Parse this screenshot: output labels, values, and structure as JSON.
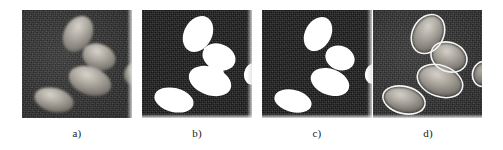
{
  "figure": {
    "panel_count": 4,
    "background_color": "#ffffff",
    "panel_background_color": "#2d2d2d",
    "mask_foreground_color": "#ffffff",
    "contour_color": "#f2f2f2"
  },
  "panels": [
    {
      "label": "a)",
      "name": "original-grayscale-image",
      "caption": "a)",
      "kind": "grayscale-microscopy",
      "object_count": 4,
      "objects": [
        {
          "id": "cell-1",
          "cx": 56,
          "cy": 24,
          "rx": 14,
          "ry": 19,
          "rot": 28,
          "fill": "#a9a49a"
        },
        {
          "id": "cell-2",
          "cx": 77,
          "cy": 47,
          "rx": 17,
          "ry": 13,
          "rot": 22,
          "fill": "#9b968e"
        },
        {
          "id": "cell-3",
          "cx": 68,
          "cy": 71,
          "rx": 22,
          "ry": 14,
          "rot": 20,
          "fill": "#a8a39a"
        },
        {
          "id": "cell-4",
          "cx": 32,
          "cy": 90,
          "rx": 20,
          "ry": 12,
          "rot": 14,
          "fill": "#9d988f"
        },
        {
          "id": "cell-5-partial",
          "cx": 110,
          "cy": 64,
          "rx": 9,
          "ry": 11,
          "rot": 10,
          "fill": "#6e6a64"
        }
      ]
    },
    {
      "label": "b)",
      "name": "binary-threshold-mask",
      "caption": "b)",
      "kind": "binary-mask",
      "object_count": 4,
      "objects": [
        {
          "id": "blob-1",
          "cx": 56,
          "cy": 24,
          "rx": 14,
          "ry": 19,
          "rot": 28,
          "fill": "#ffffff"
        },
        {
          "id": "blob-2",
          "cx": 77,
          "cy": 47,
          "rx": 17,
          "ry": 13,
          "rot": 22,
          "fill": "#ffffff"
        },
        {
          "id": "blob-3",
          "cx": 68,
          "cy": 71,
          "rx": 22,
          "ry": 14,
          "rot": 20,
          "fill": "#ffffff"
        },
        {
          "id": "blob-4",
          "cx": 32,
          "cy": 90,
          "rx": 20,
          "ry": 12,
          "rot": 14,
          "fill": "#ffffff"
        },
        {
          "id": "blob-5-partial",
          "cx": 110,
          "cy": 64,
          "rx": 9,
          "ry": 11,
          "rot": 10,
          "fill": "#ffffff"
        }
      ],
      "objects_touching": true
    },
    {
      "label": "c)",
      "name": "separated-objects-mask",
      "caption": "c)",
      "kind": "binary-mask-separated",
      "object_count": 4,
      "objects": [
        {
          "id": "blob-1",
          "cx": 56,
          "cy": 24,
          "rx": 13,
          "ry": 18,
          "rot": 28,
          "fill": "#ffffff"
        },
        {
          "id": "blob-2",
          "cx": 78,
          "cy": 48,
          "rx": 15,
          "ry": 12,
          "rot": 22,
          "fill": "#ffffff"
        },
        {
          "id": "blob-3",
          "cx": 68,
          "cy": 72,
          "rx": 20,
          "ry": 13,
          "rot": 20,
          "fill": "#ffffff"
        },
        {
          "id": "blob-4",
          "cx": 31,
          "cy": 91,
          "rx": 19,
          "ry": 11,
          "rot": 14,
          "fill": "#ffffff"
        },
        {
          "id": "blob-5-partial",
          "cx": 110,
          "cy": 64,
          "rx": 8,
          "ry": 10,
          "rot": 10,
          "fill": "#ffffff"
        }
      ],
      "objects_touching": false
    },
    {
      "label": "d)",
      "name": "contour-overlay-result",
      "caption": "d)",
      "kind": "grayscale-with-contours",
      "object_count": 4,
      "objects": [
        {
          "id": "cell-1",
          "cx": 56,
          "cy": 24,
          "rx": 14,
          "ry": 19,
          "rot": 28,
          "fill": "#a9a49a"
        },
        {
          "id": "cell-2",
          "cx": 77,
          "cy": 47,
          "rx": 17,
          "ry": 13,
          "rot": 22,
          "fill": "#9b968e"
        },
        {
          "id": "cell-3",
          "cx": 68,
          "cy": 71,
          "rx": 22,
          "ry": 14,
          "rot": 20,
          "fill": "#a8a39a"
        },
        {
          "id": "cell-4",
          "cx": 32,
          "cy": 90,
          "rx": 20,
          "ry": 12,
          "rot": 14,
          "fill": "#9d988f"
        },
        {
          "id": "cell-5-partial",
          "cx": 110,
          "cy": 64,
          "rx": 9,
          "ry": 11,
          "rot": 10,
          "fill": "#6e6a64"
        }
      ],
      "contour_stroke": "#f4f4f4",
      "contour_width": 1.6
    }
  ]
}
